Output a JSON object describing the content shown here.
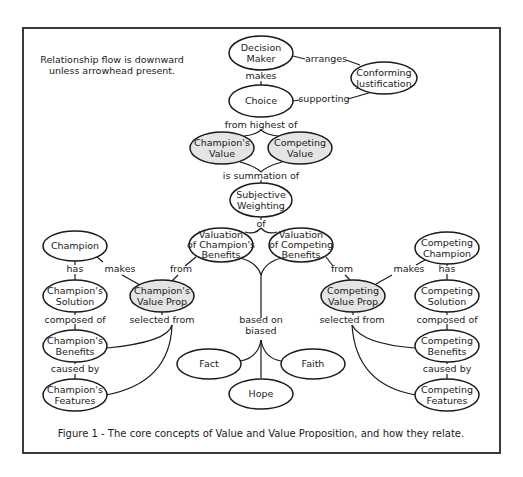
{
  "note": {
    "line1": "Relationship flow is downward",
    "line2": "unless arrowhead present."
  },
  "caption": "Figure 1 - The core concepts of Value and Value Proposition, and how they relate.",
  "colors": {
    "frame": "#3a3a3a",
    "stroke": "#1a1a1a",
    "shaded_fill": "#e4e4e4",
    "plain_fill": "#ffffff"
  },
  "nodes": {
    "decision_maker": {
      "line1": "Decision",
      "line2": "Maker"
    },
    "conforming_justification": {
      "line1": "Conforming",
      "line2": "Justification"
    },
    "choice": {
      "line1": "Choice"
    },
    "champions_value": {
      "line1": "Champion's",
      "line2": "Value"
    },
    "competing_value": {
      "line1": "Competing",
      "line2": "Value"
    },
    "subjective_weighting": {
      "line1": "Subjective",
      "line2": "Weighting"
    },
    "valuation_champions_benefits": {
      "line1": "Valuation",
      "line2": "of Champion's",
      "line3": "Benefits"
    },
    "valuation_competing_benefits": {
      "line1": "Valuation",
      "line2": "of Competing",
      "line3": "Benefits"
    },
    "champion": {
      "line1": "Champion"
    },
    "champions_solution": {
      "line1": "Champion's",
      "line2": "Solution"
    },
    "champions_benefits": {
      "line1": "Champion's",
      "line2": "Benefits"
    },
    "champions_features": {
      "line1": "Champion's",
      "line2": "Features"
    },
    "champions_value_prop": {
      "line1": "Champion's",
      "line2": "Value Prop"
    },
    "competing_champion": {
      "line1": "Competing",
      "line2": "Champion"
    },
    "competing_solution": {
      "line1": "Competing",
      "line2": "Solution"
    },
    "competing_benefits": {
      "line1": "Competing",
      "line2": "Benefits"
    },
    "competing_features": {
      "line1": "Competing",
      "line2": "Features"
    },
    "competing_value_prop": {
      "line1": "Competing",
      "line2": "Value Prop"
    },
    "fact": {
      "line1": "Fact"
    },
    "hope": {
      "line1": "Hope"
    },
    "faith": {
      "line1": "Faith"
    }
  },
  "edges": {
    "makes_choice": "makes",
    "arranges": "arranges",
    "supporting": "supporting",
    "from_highest_of": "from highest of",
    "is_summation_of": "is summation of",
    "of": "of",
    "champion_has": "has",
    "champion_makes": "makes",
    "from_left": "from",
    "composed_of_left": "composed of",
    "selected_from_left": "selected from",
    "caused_by_left": "caused by",
    "based_on": "based on",
    "biased": "biased",
    "from_right": "from",
    "competing_makes": "makes",
    "competing_has": "has",
    "selected_from_right": "selected from",
    "composed_of_right": "composed of",
    "caused_by_right": "caused by"
  }
}
